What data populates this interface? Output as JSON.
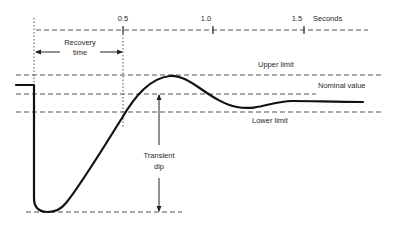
{
  "diagram": {
    "type": "transient response diagram",
    "time_axis": {
      "unit_label": "Seconds",
      "ticks": [
        "0.5",
        "1.0",
        "1.5"
      ]
    },
    "annotations": {
      "recovery_time": {
        "line1": "Recovery",
        "line2": "time"
      },
      "transient_dip": {
        "line1": "Transient",
        "line2": "dip"
      },
      "upper_limit": "Upper limit",
      "nominal_value": "Nominal value",
      "lower_limit": "Lower limit"
    },
    "colors": {
      "curve": "#111111",
      "guide_lines": "#555555",
      "text": "#2a2a2a",
      "background": "#ffffff"
    }
  }
}
